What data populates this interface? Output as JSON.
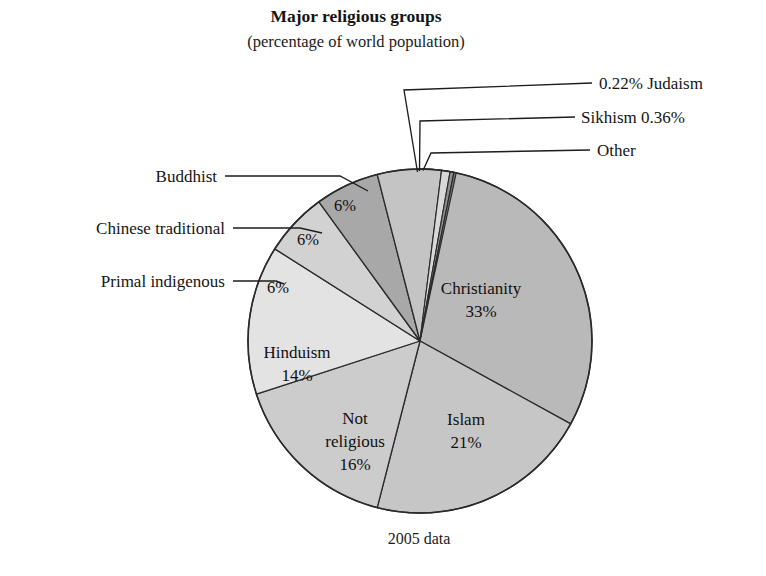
{
  "header": {
    "title": "Major religious groups",
    "subtitle": "(percentage of world population)"
  },
  "footer": {
    "caption": "2005 data"
  },
  "chart_data": {
    "type": "pie",
    "title": "Major religious groups",
    "subtitle": "(percentage of world population)",
    "caption": "2005 data",
    "unit": "percentage of world population",
    "legend_position": "callout-labels",
    "categories": [
      "Christianity",
      "Islam",
      "Not religious",
      "Hinduism",
      "Primal indigenous",
      "Chinese traditional",
      "Buddhist",
      "Other",
      "Sikhism",
      "Judaism"
    ],
    "values": [
      33,
      21,
      16,
      14,
      6,
      6,
      6,
      0.8,
      0.36,
      0.22
    ],
    "slices": [
      {
        "name": "Christianity",
        "value": 33,
        "label": "Christianity",
        "value_label": "33%",
        "color": "#b9b9b9",
        "label_placement": "inside",
        "callout": false
      },
      {
        "name": "Islam",
        "value": 21,
        "label": "Islam",
        "value_label": "21%",
        "color": "#c6c6c6",
        "label_placement": "inside",
        "callout": false
      },
      {
        "name": "Not religious",
        "value": 16,
        "label": "Not\nreligious",
        "label_line1": "Not",
        "label_line2": "religious",
        "value_label": "16%",
        "color": "#cccccc",
        "label_placement": "inside",
        "callout": false
      },
      {
        "name": "Hinduism",
        "value": 14,
        "label": "Hinduism",
        "value_label": "14%",
        "color": "#e3e3e3",
        "label_placement": "inside",
        "callout": false
      },
      {
        "name": "Primal indigenous",
        "value": 6,
        "label": "Primal indigenous",
        "value_label": "6%",
        "color": "#d2d2d2",
        "label_placement": "callout-left",
        "callout": true
      },
      {
        "name": "Chinese traditional",
        "value": 6,
        "label": "Chinese traditional",
        "value_label": "6%",
        "color": "#a8a8a8",
        "label_placement": "callout-left",
        "callout": true
      },
      {
        "name": "Buddhist",
        "value": 6,
        "label": "Buddhist",
        "value_label": "6%",
        "color": "#c4c4c4",
        "label_placement": "callout-left",
        "callout": true
      },
      {
        "name": "Other",
        "value": 0.8,
        "label": "Other",
        "value_label": "",
        "color": "#d8d8d8",
        "label_placement": "callout-right",
        "callout": true
      },
      {
        "name": "Sikhism",
        "value": 0.36,
        "label": "Sikhism 0.36%",
        "value_label": "0.36%",
        "color": "#8f8f8f",
        "label_placement": "callout-right",
        "callout": true
      },
      {
        "name": "Judaism",
        "value": 0.22,
        "label": "0.22% Judaism",
        "value_label": "0.22%",
        "color": "#6e6e6e",
        "label_placement": "callout-right",
        "callout": true
      }
    ],
    "start_angle_deg": 0,
    "direction": "clockwise",
    "total": 100
  },
  "callouts": {
    "right": [
      {
        "id": "judaism",
        "text": "0.22% Judaism"
      },
      {
        "id": "sikhism",
        "text": "Sikhism 0.36%"
      },
      {
        "id": "other",
        "text": "Other"
      }
    ],
    "left": [
      {
        "id": "buddhist",
        "text": "Buddhist"
      },
      {
        "id": "chinese-traditional",
        "text": "Chinese traditional"
      },
      {
        "id": "primal-indigenous",
        "text": "Primal indigenous"
      }
    ]
  },
  "inside_labels": {
    "christianity_name": "Christianity",
    "christianity_pct": "33%",
    "islam_name": "Islam",
    "islam_pct": "21%",
    "notreligious_l1": "Not",
    "notreligious_l2": "religious",
    "notreligious_pct": "16%",
    "hinduism_name": "Hinduism",
    "hinduism_pct": "14%",
    "primal_pct": "6%",
    "chinese_pct": "6%",
    "buddhist_pct": "6%"
  }
}
